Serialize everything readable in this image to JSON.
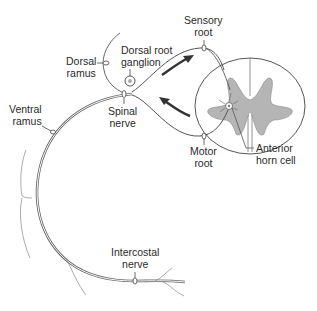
{
  "labels": {
    "dorsal_ramus": [
      "Dorsal",
      "ramus"
    ],
    "dorsal_root_ganglion": [
      "Dorsal root",
      "ganglion"
    ],
    "sensory_root": [
      "Sensory",
      "root"
    ],
    "spinal_nerve": [
      "Spinal",
      "nerve"
    ],
    "ventral_ramus": [
      "Ventral",
      "ramus"
    ],
    "motor_root": [
      "Motor",
      "root"
    ],
    "anterior_horn_cell": [
      "Anterior",
      "horn cell"
    ],
    "intercostal_nerve": [
      "Intercostal",
      "nerve"
    ]
  },
  "colors": {
    "line": "#555555",
    "gray_matter": "#b5b5b5",
    "arrow": "#333333",
    "text": "#2a2a2a"
  }
}
